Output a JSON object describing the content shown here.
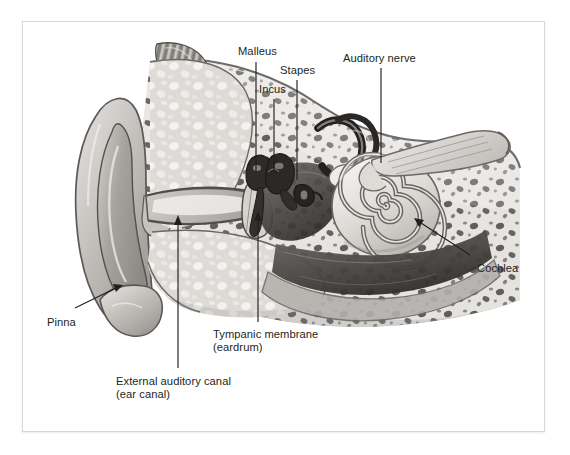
{
  "figure": {
    "background_color": "#ffffff",
    "frame_color": "#d9d9d9",
    "text_color": "#231f20",
    "art_style": "grayscale medical illustration, cross-section"
  },
  "labels": {
    "malleus": "Malleus",
    "incus": "Incus",
    "stapes": "Stapes",
    "auditory_nerve": "Auditory nerve",
    "cochlea": "Cochlea",
    "pinna": "Pinna",
    "tympanic_membrane_line1": "Tympanic membrane",
    "tympanic_membrane_line2": "(eardrum)",
    "external_auditory_canal_line1": "External auditory canal",
    "external_auditory_canal_line2": "(ear canal)"
  },
  "label_positions": {
    "malleus": {
      "x": 238,
      "y": 45
    },
    "incus": {
      "x": 259,
      "y": 83
    },
    "stapes": {
      "x": 280,
      "y": 64
    },
    "auditory_nerve": {
      "x": 343,
      "y": 52
    },
    "cochlea": {
      "x": 477,
      "y": 262
    },
    "pinna": {
      "x": 47,
      "y": 316
    },
    "tympanic_membrane": {
      "x": 213,
      "y": 328
    },
    "external_auditory_canal": {
      "x": 116,
      "y": 375
    }
  },
  "leaders": [
    {
      "name": "malleus-leader",
      "type": "line",
      "from": [
        256,
        62
      ],
      "to": [
        256,
        172
      ]
    },
    {
      "name": "incus-leader",
      "type": "line",
      "from": [
        274,
        99
      ],
      "to": [
        274,
        172
      ]
    },
    {
      "name": "stapes-leader",
      "type": "line",
      "from": [
        297,
        80
      ],
      "to": [
        297,
        180
      ]
    },
    {
      "name": "auditory-nerve-leader",
      "type": "line",
      "from": [
        381,
        68
      ],
      "to": [
        381,
        163
      ]
    },
    {
      "name": "cochlea-leader",
      "type": "arrow",
      "from": [
        470,
        255
      ],
      "to": [
        414,
        218
      ]
    },
    {
      "name": "pinna-leader",
      "type": "arrow",
      "from": [
        75,
        308
      ],
      "to": [
        122,
        285
      ]
    },
    {
      "name": "tympanic-membrane-leader",
      "type": "arrow",
      "from": [
        258,
        322
      ],
      "to": [
        258,
        213
      ]
    },
    {
      "name": "external-auditory-canal-leader",
      "type": "arrow",
      "from": [
        178,
        368
      ],
      "to": [
        178,
        216
      ]
    }
  ],
  "anatomy_parts": [
    {
      "id": "pinna",
      "name": "Pinna",
      "region": "outer ear"
    },
    {
      "id": "external-auditory-canal",
      "name": "External auditory canal (ear canal)",
      "region": "outer ear"
    },
    {
      "id": "tympanic-membrane",
      "name": "Tympanic membrane (eardrum)",
      "region": "middle ear"
    },
    {
      "id": "malleus",
      "name": "Malleus",
      "region": "middle ear ossicle"
    },
    {
      "id": "incus",
      "name": "Incus",
      "region": "middle ear ossicle"
    },
    {
      "id": "stapes",
      "name": "Stapes",
      "region": "middle ear ossicle"
    },
    {
      "id": "semicircular-canals",
      "name": "Semicircular canals",
      "region": "inner ear"
    },
    {
      "id": "cochlea",
      "name": "Cochlea",
      "region": "inner ear"
    },
    {
      "id": "auditory-nerve",
      "name": "Auditory nerve",
      "region": "inner ear"
    },
    {
      "id": "eustachian-tube",
      "name": "Eustachian tube",
      "region": "middle ear"
    }
  ],
  "palette": {
    "bone_light": "#e8e6e3",
    "bone_mid": "#c9c6c2",
    "bone_dark": "#9a9691",
    "cartilage": "#b9b5b1",
    "cavity_dark": "#3c3a38",
    "cavity_mid": "#6e6b68",
    "outline": "#55514e",
    "highlight": "#f4f3f1"
  }
}
